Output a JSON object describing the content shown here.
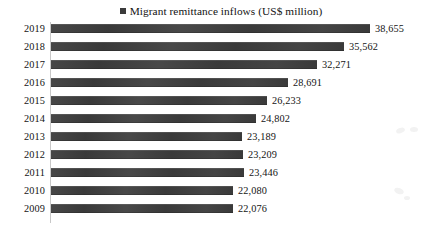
{
  "legend": {
    "marker": "square-marker-icon",
    "label": "Migrant remittance inflows (US$ million)",
    "color": "#3b3b3b"
  },
  "chart_data": {
    "type": "bar",
    "orientation": "horizontal",
    "title": "",
    "subtitle": "",
    "xlabel": "",
    "ylabel": "",
    "grid": false,
    "legend_position": "top-center",
    "series_name": "Migrant remittance inflows (US$ million)",
    "bar_color": "#3d3d3d",
    "xlim": [
      0,
      38655
    ],
    "categories": [
      "2019",
      "2018",
      "2017",
      "2016",
      "2015",
      "2014",
      "2013",
      "2012",
      "2011",
      "2010",
      "2009"
    ],
    "values": [
      38655,
      35562,
      32271,
      28691,
      26233,
      24802,
      23189,
      23209,
      23446,
      22080,
      22076
    ],
    "data_labels": [
      "38,655",
      "35,562",
      "32,271",
      "28,691",
      "26,233",
      "24,802",
      "23,189",
      "23,209",
      "23,446",
      "22,080",
      "22,076"
    ],
    "series": [
      {
        "name": "Migrant remittance inflows (US$ million)",
        "values": [
          38655,
          35562,
          32271,
          28691,
          26233,
          24802,
          23189,
          23209,
          23446,
          22080,
          22076
        ]
      }
    ]
  }
}
